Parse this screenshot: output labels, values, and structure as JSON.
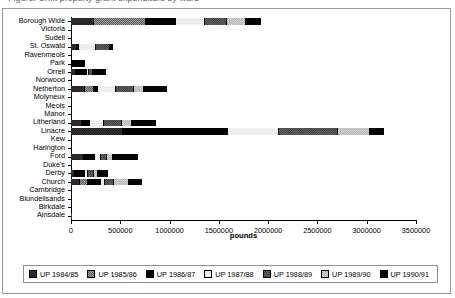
{
  "caption": {
    "text": "Figure: Unfit property grant expenditure by ward"
  },
  "chart_data": {
    "type": "bar",
    "orientation": "horizontal",
    "stacked": true,
    "title": "",
    "xlabel": "pounds",
    "ylabel": "",
    "xlim": [
      0,
      3500000
    ],
    "xticks": [
      0,
      500000,
      1000000,
      1500000,
      2000000,
      2500000,
      3000000,
      3500000
    ],
    "xtick_labels": [
      "0",
      "500000",
      "1000000",
      "1500000",
      "2000000",
      "2500000",
      "3000000",
      "3500000"
    ],
    "grid": false,
    "legend_position": "bottom",
    "categories": [
      "Borough Wide",
      "Victoria",
      "Sudell",
      "St. Oswald",
      "Ravenmeols",
      "Park",
      "Orrell",
      "Norwood",
      "Netherton",
      "Molyneux",
      "Meols",
      "Manor",
      "Litherland",
      "Linacre",
      "Kew",
      "Harington",
      "Ford",
      "Duke's",
      "Derby",
      "Church",
      "Cambridge",
      "Blundellsands",
      "Birkdale",
      "Ainsdale"
    ],
    "series": [
      {
        "name": "UP 1984/85",
        "color": "#3a3a3a",
        "pattern": "dark-checker",
        "values": [
          230000,
          0,
          0,
          60000,
          0,
          0,
          55000,
          0,
          140000,
          0,
          0,
          0,
          115000,
          530000,
          0,
          0,
          130000,
          0,
          40000,
          95000,
          0,
          0,
          0,
          5000
        ]
      },
      {
        "name": "UP 1985/86",
        "color": "#9e9e9e",
        "pattern": "grey-dots",
        "values": [
          530000,
          0,
          0,
          0,
          0,
          0,
          0,
          0,
          95000,
          0,
          0,
          0,
          0,
          0,
          0,
          0,
          0,
          0,
          0,
          75000,
          0,
          0,
          0,
          0
        ]
      },
      {
        "name": "UP 1986/87",
        "color": "#000000",
        "pattern": "solid-black",
        "values": [
          310000,
          0,
          0,
          20000,
          0,
          140000,
          110000,
          0,
          35000,
          0,
          0,
          0,
          75000,
          1060000,
          0,
          0,
          110000,
          0,
          105000,
          130000,
          0,
          0,
          0,
          0
        ]
      },
      {
        "name": "UP 1987/88",
        "color": "#f2f2f2",
        "pattern": "white",
        "values": [
          290000,
          0,
          0,
          170000,
          0,
          0,
          20000,
          0,
          190000,
          0,
          0,
          0,
          145000,
          520000,
          0,
          0,
          60000,
          0,
          30000,
          45000,
          0,
          0,
          0,
          0
        ]
      },
      {
        "name": "UP 1988/89",
        "color": "#6b6b6b",
        "pattern": "dark-grey-checker",
        "values": [
          220000,
          0,
          0,
          145000,
          0,
          0,
          35000,
          0,
          180000,
          0,
          0,
          0,
          185000,
          600000,
          0,
          0,
          65000,
          0,
          55000,
          95000,
          0,
          0,
          0,
          0
        ]
      },
      {
        "name": "UP 1989/90",
        "color": "#d2d2d2",
        "pattern": "light-grey",
        "values": [
          195000,
          0,
          0,
          0,
          0,
          0,
          0,
          0,
          100000,
          0,
          0,
          0,
          100000,
          320000,
          0,
          0,
          65000,
          0,
          40000,
          145000,
          0,
          0,
          0,
          0
        ]
      },
      {
        "name": "UP 1990/91",
        "color": "#050505",
        "pattern": "solid-black-2",
        "values": [
          150000,
          0,
          0,
          35000,
          0,
          0,
          135000,
          0,
          230000,
          0,
          0,
          0,
          245000,
          150000,
          0,
          0,
          250000,
          0,
          105000,
          135000,
          0,
          0,
          0,
          0
        ]
      }
    ]
  },
  "legend": {
    "items": [
      {
        "label": "UP 1984/85"
      },
      {
        "label": "UP 1985/86"
      },
      {
        "label": "UP 1986/87"
      },
      {
        "label": "UP 1987/88"
      },
      {
        "label": "UP 1988/89"
      },
      {
        "label": "UP 1989/90"
      },
      {
        "label": "UP 1990/91"
      }
    ]
  }
}
